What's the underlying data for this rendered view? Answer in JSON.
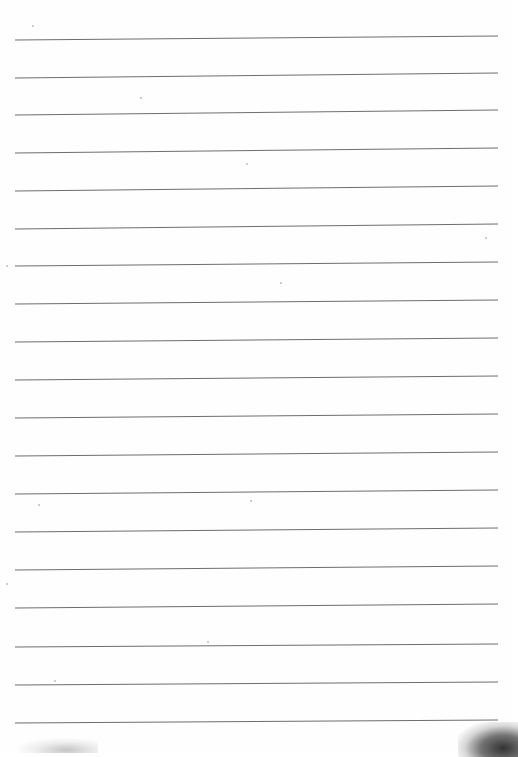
{
  "document": {
    "type": "blank lined paper",
    "line_color": "#6e6e6e",
    "paper_color": "#fefefe",
    "line_count": 19,
    "lines": [
      {
        "y_left": 40,
        "y_right": 36
      },
      {
        "y_left": 78,
        "y_right": 73
      },
      {
        "y_left": 115,
        "y_right": 110
      },
      {
        "y_left": 153,
        "y_right": 148
      },
      {
        "y_left": 191,
        "y_right": 186
      },
      {
        "y_left": 229,
        "y_right": 224
      },
      {
        "y_left": 266,
        "y_right": 262
      },
      {
        "y_left": 304,
        "y_right": 300
      },
      {
        "y_left": 342,
        "y_right": 338
      },
      {
        "y_left": 380,
        "y_right": 376
      },
      {
        "y_left": 418,
        "y_right": 414
      },
      {
        "y_left": 456,
        "y_right": 452
      },
      {
        "y_left": 494,
        "y_right": 490
      },
      {
        "y_left": 532,
        "y_right": 528
      },
      {
        "y_left": 570,
        "y_right": 566
      },
      {
        "y_left": 608,
        "y_right": 604
      },
      {
        "y_left": 647,
        "y_right": 644
      },
      {
        "y_left": 685,
        "y_right": 682
      },
      {
        "y_left": 723,
        "y_right": 720
      }
    ],
    "x_start": 15,
    "x_end": 498
  }
}
